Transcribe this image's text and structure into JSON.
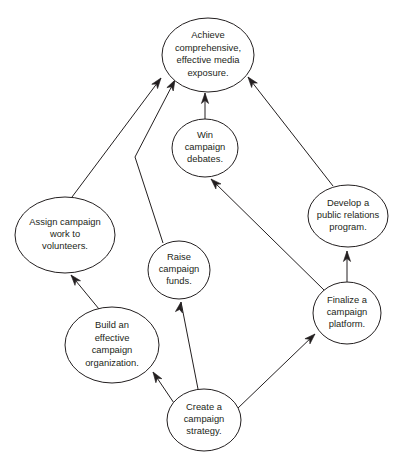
{
  "diagram": {
    "type": "directed-graph",
    "title": "",
    "background_color": "#ffffff",
    "stroke_color": "#231f20",
    "node_fill": "#ffffff",
    "nodes": [
      {
        "id": "achieve",
        "label": "Achieve comprehensive, effective media exposure.",
        "lines": [
          "Achieve",
          "comprehensive,",
          "effective media",
          "exposure."
        ],
        "cx": 208,
        "cy": 55,
        "rx": 46,
        "ry": 37
      },
      {
        "id": "debates",
        "label": "Win campaign debates.",
        "lines": [
          "Win",
          "campaign",
          "debates."
        ],
        "cx": 205,
        "cy": 148,
        "rx": 33,
        "ry": 29
      },
      {
        "id": "public_relations",
        "label": "Develop a public relations program.",
        "lines": [
          "Develop a",
          "public relations",
          "program."
        ],
        "cx": 348,
        "cy": 216,
        "rx": 40,
        "ry": 31
      },
      {
        "id": "volunteers",
        "label": "Assign campaign work to volunteers.",
        "lines": [
          "Assign campaign",
          "work to",
          "volunteers."
        ],
        "cx": 65,
        "cy": 235,
        "rx": 50,
        "ry": 38
      },
      {
        "id": "funds",
        "label": "Raise campaign funds.",
        "lines": [
          "Raise",
          "campaign",
          "funds."
        ],
        "cx": 179,
        "cy": 270,
        "rx": 31,
        "ry": 29
      },
      {
        "id": "platform",
        "label": "Finalize a campaign platform.",
        "lines": [
          "Finalize a",
          "campaign",
          "platform."
        ],
        "cx": 347,
        "cy": 313,
        "rx": 34,
        "ry": 31
      },
      {
        "id": "organization",
        "label": "Build an effective campaign organization.",
        "lines": [
          "Build an",
          "effective",
          "campaign",
          "organization."
        ],
        "cx": 112,
        "cy": 345,
        "rx": 47,
        "ry": 38
      },
      {
        "id": "strategy",
        "label": "Create a campaign strategy.",
        "lines": [
          "Create a",
          "campaign",
          "strategy."
        ],
        "cx": 204,
        "cy": 420,
        "rx": 37,
        "ry": 31
      }
    ],
    "edges": [
      {
        "from": "volunteers",
        "to": "achieve",
        "points": "72,197 161,78",
        "arrow_at": "161,78",
        "arrow_angle": -53
      },
      {
        "from": "funds",
        "to": "achieve",
        "points": "163,243 135,157 175,80",
        "arrow_at": "175,80",
        "arrow_angle": -62
      },
      {
        "from": "debates",
        "to": "achieve",
        "points": "205,119 205,93",
        "arrow_at": "205,93",
        "arrow_angle": -90
      },
      {
        "from": "public_relations",
        "to": "achieve",
        "points": "333,186 248,77",
        "arrow_at": "248,77",
        "arrow_angle": -128
      },
      {
        "from": "platform",
        "to": "debates",
        "points": "325,291 211,179",
        "arrow_at": "211,179",
        "arrow_angle": -135
      },
      {
        "from": "platform",
        "to": "public_relations",
        "points": "347,282 347,251",
        "arrow_at": "347,251",
        "arrow_angle": -90
      },
      {
        "from": "organization",
        "to": "volunteers",
        "points": "99,309 71,275",
        "arrow_at": "71,275",
        "arrow_angle": -130
      },
      {
        "from": "strategy",
        "to": "organization",
        "points": "176,406 153,372",
        "arrow_at": "153,372",
        "arrow_angle": -124
      },
      {
        "from": "strategy",
        "to": "funds",
        "points": "198,389 181,302",
        "arrow_at": "181,302",
        "arrow_angle": -79
      },
      {
        "from": "strategy",
        "to": "platform",
        "points": "237,409 315,334",
        "arrow_at": "315,334",
        "arrow_angle": -44
      }
    ]
  }
}
